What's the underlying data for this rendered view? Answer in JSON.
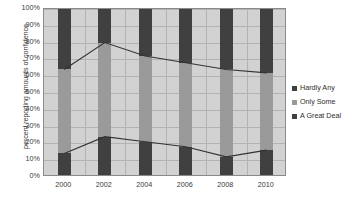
{
  "chart_data": {
    "type": "bar",
    "subtype": "stacked-bar-with-line-overlay",
    "title": "",
    "xlabel": "",
    "ylabel": "percent reporting amounts of confidence",
    "categories": [
      "2000",
      "2002",
      "2004",
      "2006",
      "2008",
      "2010"
    ],
    "ylim": [
      0,
      100
    ],
    "ytick_labels": [
      "0%",
      "10%",
      "20%",
      "30%",
      "40%",
      "50%",
      "60%",
      "70%",
      "80%",
      "90%",
      "100%"
    ],
    "ytick_values": [
      0,
      10,
      20,
      30,
      40,
      50,
      60,
      70,
      80,
      90,
      100
    ],
    "grid": true,
    "legend_position": "right",
    "series": [
      {
        "name": "A Great Deal",
        "color": "#404040",
        "values": [
          14,
          24,
          21,
          18,
          12,
          16
        ]
      },
      {
        "name": "Only Some",
        "color": "#9a9a9a",
        "values": [
          50,
          56,
          51,
          50,
          52,
          46
        ]
      },
      {
        "name": "Hardly Any",
        "color": "#404040",
        "values": [
          36,
          20,
          28,
          32,
          36,
          38
        ]
      }
    ],
    "cumulative_lines": [
      {
        "name": "A Great Deal cumulative",
        "values": [
          14,
          24,
          21,
          18,
          12,
          16
        ]
      },
      {
        "name": "A Great Deal + Only Some cumulative",
        "values": [
          64,
          80,
          72,
          68,
          64,
          62
        ]
      }
    ],
    "legend": [
      {
        "label": "Hardly Any",
        "color": "#404040",
        "swatch": "square-dark"
      },
      {
        "label": "Only Some",
        "color": "#9a9a9a",
        "swatch": "square-gray"
      },
      {
        "label": "A Great Deal",
        "color": "#404040",
        "swatch": "square-dark"
      }
    ],
    "colors": {
      "plot_background": "#d2d2d2",
      "gridline": "#b3b3b3",
      "border": "#8a8a8a",
      "line": "#333333",
      "text": "#3a3a3a"
    }
  }
}
